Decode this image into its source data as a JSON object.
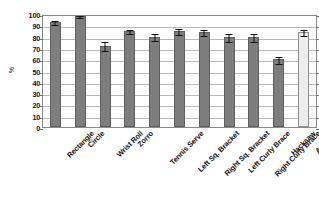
{
  "chart_data": {
    "type": "bar",
    "title": "",
    "xlabel": "",
    "ylabel": "%",
    "ylim": [
      0,
      100
    ],
    "yticks": [
      100,
      90,
      80,
      70,
      60,
      50,
      40,
      30,
      20,
      10,
      0
    ],
    "grid": true,
    "legend": "none",
    "categories": [
      "Rectangle",
      "Circle",
      "Wrist Roll",
      "Zorro",
      "Tennis Serve",
      "Left Sq. Bracket",
      "Right Sq. Bracket",
      "Left Curly Brace",
      "Right Curly Brace",
      "Hacksaw",
      "Average"
    ],
    "values": [
      93,
      98,
      72,
      85,
      80,
      85,
      84,
      80,
      80,
      60,
      84
    ],
    "errors": [
      1.5,
      1.0,
      4.0,
      2.0,
      3.0,
      2.5,
      3.0,
      3.5,
      3.5,
      3.0,
      2.5
    ],
    "bar_styles": [
      "dark",
      "dark",
      "dark",
      "dark",
      "dark",
      "dark",
      "dark",
      "dark",
      "dark",
      "dark",
      "light"
    ],
    "colors": {
      "bar_fill_dark": "#7d7d7d",
      "bar_fill_light": "#ededed",
      "bar_border": "#5f5f5f",
      "grid": "#b9b9b9",
      "frame": "#8a8a8a",
      "text": "#111111",
      "error_bar": "#111111",
      "background": "#ffffff"
    }
  }
}
